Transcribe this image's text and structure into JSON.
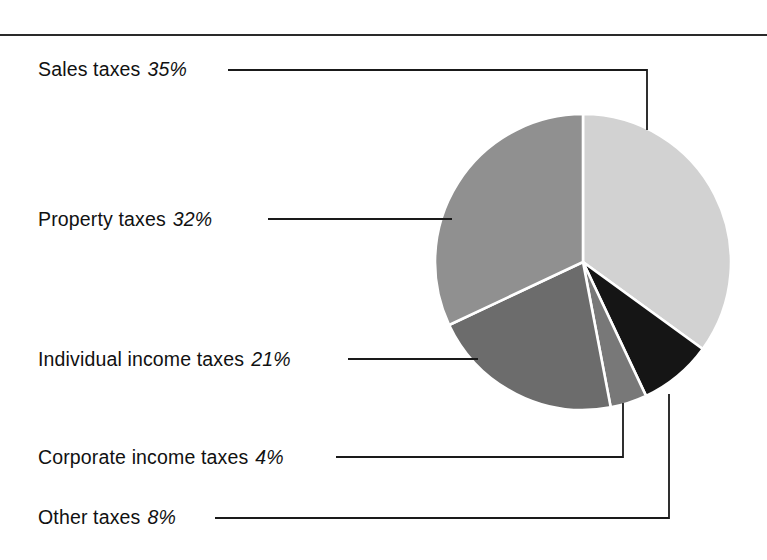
{
  "figure": {
    "background_color": "#ffffff",
    "rule_color": "#2a2a2a",
    "width": 767,
    "height": 560
  },
  "chart_data": {
    "type": "pie",
    "title": "",
    "subtitle": "",
    "xlabel": "",
    "ylabel": "",
    "legend_position": "callout-labels-left",
    "grid": false,
    "start_angle_deg": 0,
    "direction": "clockwise",
    "center": {
      "x": 583,
      "y": 262
    },
    "radius": 148,
    "categories": [
      "Sales taxes",
      "Other taxes",
      "Corporate income taxes",
      "Individual income taxes",
      "Property taxes"
    ],
    "values": [
      35,
      8,
      4,
      21,
      32
    ],
    "unit": "%",
    "total": 100,
    "slices": [
      {
        "name": "Sales taxes",
        "value": 35,
        "value_text": "35%",
        "color": "#d2d2d2",
        "label_text": "Sales taxes",
        "start_deg": 0,
        "end_deg": 126
      },
      {
        "name": "Other taxes",
        "value": 8,
        "value_text": "8%",
        "color": "#151515",
        "label_text": "Other taxes",
        "start_deg": 126,
        "end_deg": 154.8
      },
      {
        "name": "Corporate income taxes",
        "value": 4,
        "value_text": "4%",
        "color": "#787878",
        "label_text": "Corporate income taxes",
        "start_deg": 154.8,
        "end_deg": 169.2
      },
      {
        "name": "Individual income taxes",
        "value": 21,
        "value_text": "21%",
        "color": "#6c6c6c",
        "label_text": "Individual income taxes",
        "start_deg": 169.2,
        "end_deg": 244.8
      },
      {
        "name": "Property taxes",
        "value": 32,
        "value_text": "32%",
        "color": "#909090",
        "label_text": "Property taxes",
        "start_deg": 244.8,
        "end_deg": 360
      }
    ]
  },
  "callouts": {
    "sales": {
      "label": "Sales taxes",
      "percent": "35%"
    },
    "property": {
      "label": "Property taxes",
      "percent": "32%"
    },
    "individual": {
      "label": "Individual income taxes",
      "percent": "21%"
    },
    "corporate": {
      "label": "Corporate income taxes",
      "percent": "4%"
    },
    "other": {
      "label": "Other taxes",
      "percent": "8%"
    }
  }
}
